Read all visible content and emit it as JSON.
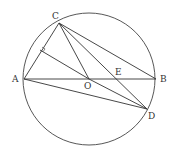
{
  "diagram": {
    "type": "geometry",
    "circle": {
      "center": "O",
      "cx": 89,
      "cy": 79,
      "r": 66
    },
    "points": {
      "A": {
        "label": "A",
        "x": 24,
        "y": 79,
        "lx": 12,
        "ly": 82
      },
      "B": {
        "label": "B",
        "x": 156,
        "y": 79,
        "lx": 160,
        "ly": 82
      },
      "C": {
        "label": "C",
        "x": 59,
        "y": 23,
        "lx": 52,
        "ly": 19
      },
      "D": {
        "label": "D",
        "x": 147,
        "y": 109,
        "lx": 148,
        "ly": 119
      },
      "O": {
        "label": "O",
        "x": 89,
        "y": 79,
        "lx": 84,
        "ly": 89
      },
      "E": {
        "label": "E",
        "x": 116,
        "y": 79,
        "lx": 115,
        "ly": 75
      },
      "F": {
        "x": 40,
        "y": 50
      }
    },
    "segments": [
      [
        "A",
        "B"
      ],
      [
        "A",
        "C"
      ],
      [
        "C",
        "B"
      ],
      [
        "C",
        "O"
      ],
      [
        "C",
        "D"
      ],
      [
        "A",
        "D"
      ],
      [
        "O",
        "D"
      ],
      [
        "O",
        "F"
      ]
    ],
    "right_angle_at": "F"
  }
}
